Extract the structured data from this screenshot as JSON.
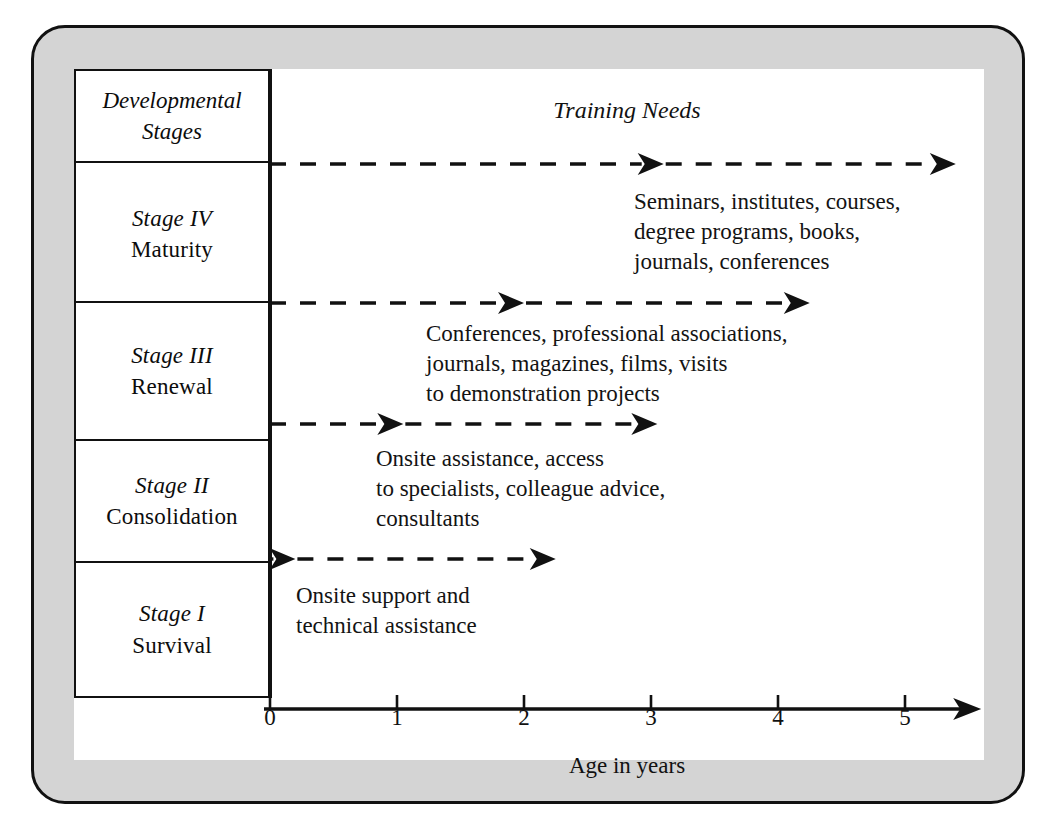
{
  "figure": {
    "title": "Training Needs",
    "stage_column_header": "Developmental\nStages",
    "axis_title": "Age in years",
    "colors": {
      "plate_fill": "#d4d4d4",
      "canvas_fill": "#ffffff",
      "ink": "#111111"
    }
  },
  "axis": {
    "ticks": [
      {
        "label": "0",
        "value": 0
      },
      {
        "label": "1",
        "value": 1
      },
      {
        "label": "2",
        "value": 2
      },
      {
        "label": "3",
        "value": 3
      },
      {
        "label": "4",
        "value": 4
      },
      {
        "label": "5",
        "value": 5
      }
    ],
    "range": [
      0,
      5.6
    ],
    "title": "Age in years"
  },
  "stages": [
    {
      "id": "stage-4",
      "roman": "Stage IV",
      "name": "Maturity",
      "needs": "Seminars, institutes, courses,\ndegree programs, books,\njournals, conferences",
      "arrow_start": 0,
      "arrow_mid_head": 3.1,
      "arrow_end": 5.4
    },
    {
      "id": "stage-3",
      "roman": "Stage III",
      "name": "Renewal",
      "needs": "Conferences, professional associations,\njournals, magazines, films, visits\nto demonstration projects",
      "arrow_start": 0,
      "arrow_mid_head": 2.0,
      "arrow_end": 4.25
    },
    {
      "id": "stage-2",
      "roman": "Stage II",
      "name": "Consolidation",
      "needs": "Onsite assistance, access\nto specialists, colleague advice,\nconsultants",
      "arrow_start": 0,
      "arrow_mid_head": 1.05,
      "arrow_end": 3.05
    },
    {
      "id": "stage-1",
      "roman": "Stage I",
      "name": "Survival",
      "needs": "Onsite support and\ntechnical assistance",
      "arrow_start": 0,
      "arrow_mid_head": 0.2,
      "arrow_end": 2.25
    }
  ],
  "chart_data": {
    "type": "diagram-timeline",
    "title": "Training Needs",
    "xlabel": "Age in years",
    "ylabel": "Developmental Stages",
    "xlim": [
      0,
      5.6
    ],
    "xticks": [
      0,
      1,
      2,
      3,
      4,
      5
    ],
    "grid": false,
    "legend": "none",
    "categories": [
      "Stage I Survival",
      "Stage II Consolidation",
      "Stage III Renewal",
      "Stage IV Maturity"
    ],
    "series": [
      {
        "name": "Stage I Survival",
        "span_start": 0,
        "span_end": 2.25,
        "intermediate_marker": 0.2,
        "annotation": "Onsite support and technical assistance"
      },
      {
        "name": "Stage II Consolidation",
        "span_start": 0,
        "span_end": 3.05,
        "intermediate_marker": 1.05,
        "annotation": "Onsite assistance, access to specialists, colleague advice, consultants"
      },
      {
        "name": "Stage III Renewal",
        "span_start": 0,
        "span_end": 4.25,
        "intermediate_marker": 2.0,
        "annotation": "Conferences, professional associations, journals, magazines, films, visits to demonstration projects"
      },
      {
        "name": "Stage IV Maturity",
        "span_start": 0,
        "span_end": 5.4,
        "intermediate_marker": 3.1,
        "annotation": "Seminars, institutes, courses, degree programs, books, journals, conferences"
      }
    ]
  }
}
